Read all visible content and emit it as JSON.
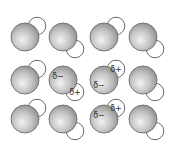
{
  "diagram": {
    "title": "",
    "colors": {
      "oxygen_highlight": "#f2f2f2",
      "oxygen_mid": "#c4c4c4",
      "oxygen_edge": "#8f8f8f",
      "hydrogen_fill": "#ffffff",
      "outline": "#6e6e6e",
      "label": "#2e2e2e"
    },
    "rows": [
      {
        "molecules": [
          {
            "h_direction": "upper-right",
            "o_label": "",
            "h_label": ""
          },
          {
            "h_direction": "lower-right",
            "o_label": "",
            "h_label": ""
          },
          {
            "h_direction": "upper-right",
            "o_label": "",
            "h_label": ""
          },
          {
            "h_direction": "lower-right",
            "o_label": "",
            "h_label": ""
          }
        ]
      },
      {
        "molecules": [
          {
            "h_direction": "upper-right",
            "o_label": "",
            "h_label": ""
          },
          {
            "h_direction": "lower-right",
            "o_label": "δ−",
            "h_label": "δ+"
          },
          {
            "h_direction": "upper-right",
            "o_label": "δ−",
            "h_label": "δ+"
          },
          {
            "h_direction": "lower-right",
            "o_label": "",
            "h_label": ""
          }
        ]
      },
      {
        "molecules": [
          {
            "h_direction": "upper-right",
            "o_label": "",
            "h_label": ""
          },
          {
            "h_direction": "lower-right",
            "o_label": "",
            "h_label": ""
          },
          {
            "h_direction": "upper-right",
            "o_label": "δ−",
            "h_label": "δ+"
          },
          {
            "h_direction": "lower-right",
            "o_label": "",
            "h_label": ""
          }
        ]
      }
    ]
  }
}
